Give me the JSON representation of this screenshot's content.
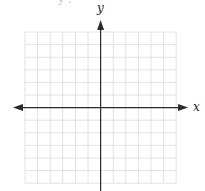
{
  "diagram": {
    "type": "coordinate-plane",
    "axes": {
      "x_label": "x",
      "y_label": "y",
      "arrows": {
        "x": "both",
        "y": "both"
      }
    },
    "grid": {
      "columns": 12,
      "rows": 12,
      "columns_each_side": 6,
      "rows_each_side": 6,
      "left": 25,
      "top": 32,
      "cell": 12.6
    },
    "colors": {
      "grid": "#e2e2e2",
      "axis": "#2b2b2b",
      "background": "#ffffff"
    },
    "top_fragment": "y ."
  }
}
